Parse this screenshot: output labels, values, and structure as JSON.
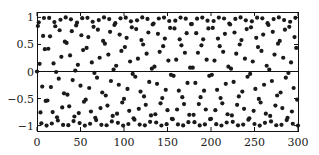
{
  "chart_data": {
    "type": "scatter",
    "title": "",
    "xlabel": "",
    "ylabel": "",
    "function": "y = sin(n), n = 0..300 (integer)",
    "x_start": 0,
    "x_end": 300,
    "x_step": 1,
    "xlim": [
      0,
      300
    ],
    "ylim": [
      -1.1,
      1.1
    ],
    "xticks": [
      0,
      50,
      100,
      150,
      200,
      250,
      300
    ],
    "xtick_labels": [
      "0",
      "50",
      "100",
      "150",
      "200",
      "250",
      "300"
    ],
    "yticks": [
      -1,
      -0.5,
      0,
      0.5,
      1
    ],
    "ytick_labels": [
      "−1",
      "−0.5",
      "0",
      "0.5",
      "1"
    ],
    "zero_line": true,
    "grid": false,
    "legend": null,
    "marker_color": "#1a1a1a",
    "marker_radius": 2.1
  },
  "axes": {
    "left": 37,
    "right": 298,
    "top": 12,
    "bottom": 131
  }
}
